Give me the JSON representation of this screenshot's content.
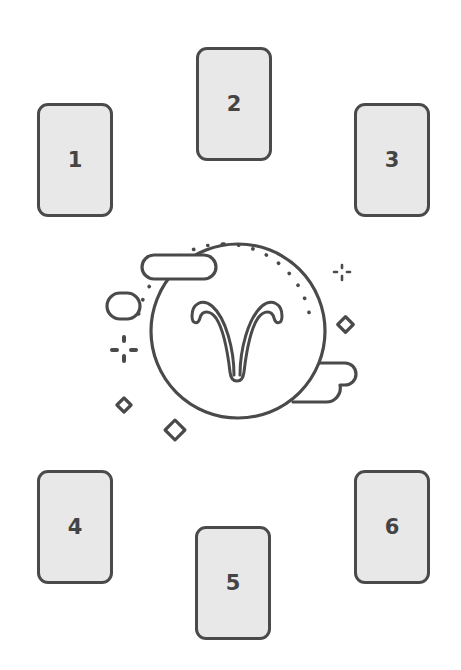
{
  "colors": {
    "stroke": "#4a4a4a",
    "card_fill": "#e8e8e8",
    "card_text": "#444444",
    "background": "#ffffff"
  },
  "cards": [
    {
      "label": "1",
      "x": 37,
      "y": 103
    },
    {
      "label": "2",
      "x": 196,
      "y": 47
    },
    {
      "label": "3",
      "x": 354,
      "y": 103
    },
    {
      "label": "4",
      "x": 37,
      "y": 470
    },
    {
      "label": "5",
      "x": 195,
      "y": 526
    },
    {
      "label": "6",
      "x": 354,
      "y": 470
    }
  ],
  "center_symbol": {
    "icon": "aries-zodiac-icon",
    "glyph": "♈",
    "circle": {
      "cx": 238,
      "cy": 331,
      "r": 87
    }
  }
}
